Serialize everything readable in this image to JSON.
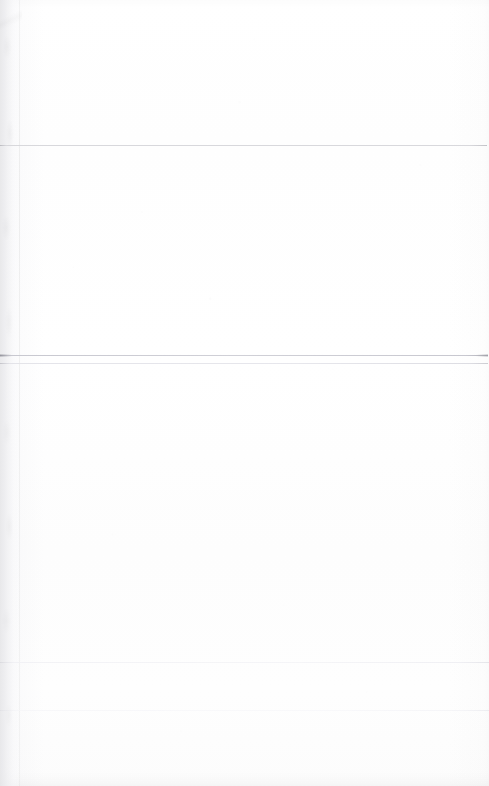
{
  "document": {
    "kind": "scanned-page",
    "appearance": "blank",
    "visible_text": "",
    "page_width": 489,
    "page_height": 786,
    "background_color": "#ffffff",
    "paper_tone_color": "#fdfdfd",
    "notes_text": ""
  },
  "page_edge": {
    "name": "left-binding-edge",
    "x": 0,
    "width": 21,
    "height": 786,
    "color": "#e9e9ec",
    "boundary_line_x": 19,
    "boundary_color": "#f0f0f2"
  },
  "bottom_edge": {
    "name": "bottom-page-edge",
    "y": 772,
    "height": 14,
    "color": "#f4f4f5"
  },
  "top_edge": {
    "name": "top-page-edge",
    "y": 0,
    "height": 8,
    "color": "#f8f8f9"
  },
  "rules": [
    {
      "name": "rule-upper",
      "y": 145,
      "x": 0,
      "width": 487,
      "color": "#d6d6da",
      "weight": "hairline",
      "opacity": 0.95
    },
    {
      "name": "rule-middle-primary",
      "y": 355,
      "x": 0,
      "width": 488,
      "color": "#d2d2d7",
      "weight": "hairline",
      "opacity": 1.0
    },
    {
      "name": "rule-middle-secondary",
      "y": 363,
      "x": 0,
      "width": 488,
      "color": "#e4e4e8",
      "weight": "hairline",
      "opacity": 0.85
    },
    {
      "name": "rule-lower-faint",
      "y": 662,
      "x": 0,
      "width": 489,
      "color": "#f2f2f4",
      "weight": "soft",
      "opacity": 0.8
    },
    {
      "name": "rule-bottom-faint",
      "y": 710,
      "x": 0,
      "width": 489,
      "color": "#f5f5f7",
      "weight": "soft",
      "opacity": 0.7
    }
  ],
  "regions": [
    {
      "name": "header-band",
      "y": 0,
      "height": 145,
      "text": ""
    },
    {
      "name": "upper-body-band",
      "y": 146,
      "height": 209,
      "text": ""
    },
    {
      "name": "main-body-band",
      "y": 364,
      "height": 298,
      "text": ""
    },
    {
      "name": "lower-body-band",
      "y": 663,
      "height": 47,
      "text": ""
    },
    {
      "name": "footer-band",
      "y": 711,
      "height": 75,
      "text": ""
    }
  ]
}
